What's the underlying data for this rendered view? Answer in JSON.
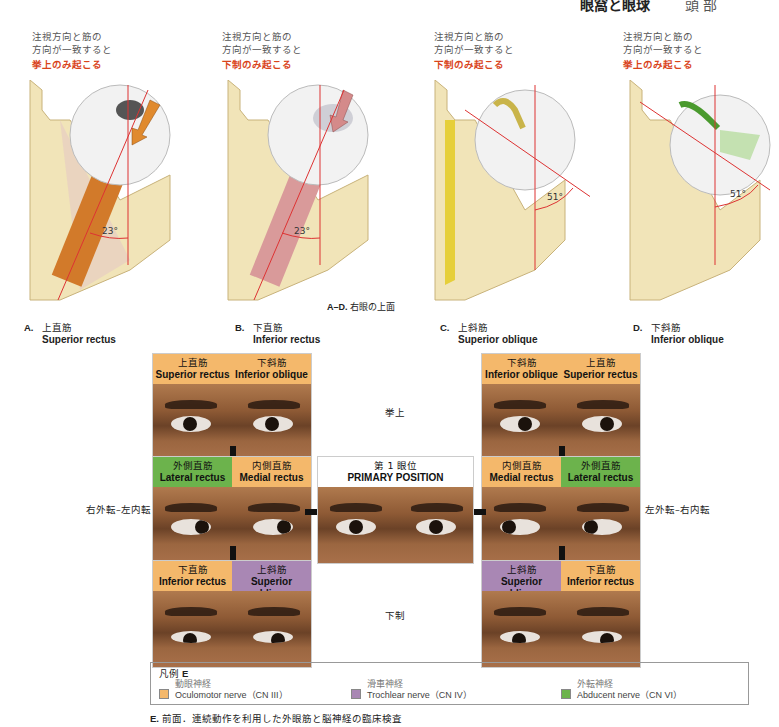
{
  "header": {
    "title": "眼窩と眼球",
    "section": "頭 部"
  },
  "notes": [
    {
      "line1": "注視方向と筋の",
      "line2": "方向が一致すると",
      "result": "挙上のみ起こる"
    },
    {
      "line1": "注視方向と筋の",
      "line2": "方向が一致すると",
      "result": "下制のみ起こる"
    },
    {
      "line1": "注視方向と筋の",
      "line2": "方向が一致すると",
      "result": "下制のみ起こる"
    },
    {
      "line1": "注視方向と筋の",
      "line2": "方向が一致すると",
      "result": "挙上のみ起こる"
    }
  ],
  "panels": [
    {
      "letter": "A.",
      "jp": "上直筋",
      "en": "Superior rectus",
      "angle": "23°",
      "muscle_color": "#d27a2a",
      "arrow_color": "#e08a2e"
    },
    {
      "letter": "B.",
      "jp": "下直筋",
      "en": "Inferior rectus",
      "angle": "23°",
      "muscle_color": "#d99a9a",
      "arrow_color": "#d48a8a"
    },
    {
      "letter": "C.",
      "jp": "上斜筋",
      "en": "Superior oblique",
      "angle": "51°",
      "muscle_color": "#e6cf3a",
      "arrow_color": "#c9b44a"
    },
    {
      "letter": "D.",
      "jp": "下斜筋",
      "en": "Inferior oblique",
      "angle": "51°",
      "muscle_color": "#7fbf5a",
      "arrow_color": "#4a9a2e"
    }
  ],
  "ad_caption": {
    "label": "A–D.",
    "text": "右眼の上面"
  },
  "photos": {
    "top_left": {
      "left": {
        "jp": "上直筋",
        "en": "Superior rectus"
      },
      "right": {
        "jp": "下斜筋",
        "en": "Inferior oblique"
      }
    },
    "top_right": {
      "left": {
        "jp": "下斜筋",
        "en": "Inferior oblique"
      },
      "right": {
        "jp": "上直筋",
        "en": "Superior rectus"
      }
    },
    "mid_left": {
      "left": {
        "jp": "外側直筋",
        "en": "Lateral rectus"
      },
      "right": {
        "jp": "内側直筋",
        "en": "Medial rectus"
      }
    },
    "center": {
      "jp": "第 1 眼位",
      "en": "PRIMARY POSITION"
    },
    "mid_right": {
      "left": {
        "jp": "内側直筋",
        "en": "Medial rectus"
      },
      "right": {
        "jp": "外側直筋",
        "en": "Lateral rectus"
      }
    },
    "bot_left": {
      "left": {
        "jp": "下直筋",
        "en": "Inferior rectus"
      },
      "right": {
        "jp": "上斜筋",
        "en": "Superior oblique"
      }
    },
    "bot_right": {
      "left": {
        "jp": "上斜筋",
        "en": "Superior oblique"
      },
      "right": {
        "jp": "下直筋",
        "en": "Inferior rectus"
      }
    }
  },
  "row_labels": {
    "up": "挙上",
    "down": "下制",
    "left": "右外転–左内転",
    "right": "左外転–右内転"
  },
  "legend": {
    "title_jp": "凡例",
    "title_letter": "E",
    "items": [
      {
        "jp": "動眼神経",
        "en": "Oculomotor nerve（CN III）",
        "color": "#f4b86b"
      },
      {
        "jp": "滑車神経",
        "en": "Trochlear nerve（CN IV）",
        "color": "#a987b4"
      },
      {
        "jp": "外転神経",
        "en": "Abducent nerve（CN VI）",
        "color": "#6cb34c"
      }
    ]
  },
  "footer": {
    "letter": "E.",
    "text": "前面．連続動作を利用した外眼筋と脳神経の臨床検査"
  }
}
